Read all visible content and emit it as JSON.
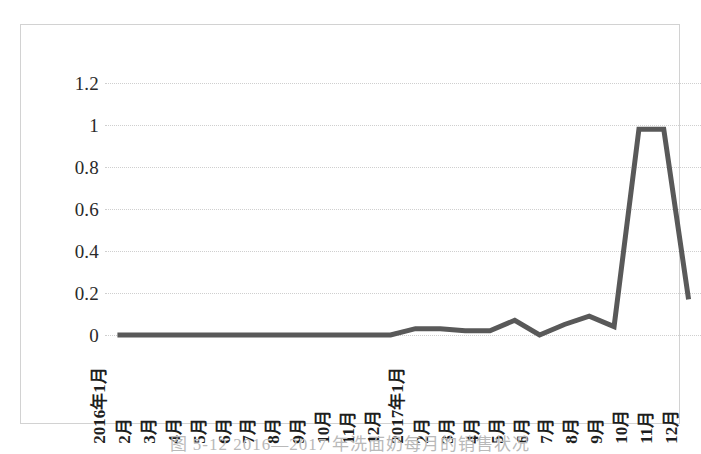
{
  "figure": {
    "caption": "图 5-12  2016—2017 年洗面奶每月的销售状况"
  },
  "chart_data": {
    "type": "line",
    "title": "",
    "subtitle": "",
    "xlabel": "",
    "ylabel": "",
    "ylim": [
      0,
      1.2
    ],
    "y_ticks": [
      "0",
      "0.2",
      "0.4",
      "0.6",
      "0.8",
      "1",
      "1.2"
    ],
    "y_tick_values": [
      0,
      0.2,
      0.4,
      0.6,
      0.8,
      1,
      1.2
    ],
    "grid": true,
    "legend": false,
    "legend_position": "none",
    "line_color": "#595959",
    "line_width": 5,
    "markers": false,
    "categories": [
      "2016年1月",
      "2月",
      "3月",
      "4月",
      "5月",
      "6月",
      "7月",
      "8月",
      "9月",
      "10月",
      "11月",
      "12月",
      "2017年1月",
      "2月",
      "3月",
      "4月",
      "5月",
      "6月",
      "7月",
      "8月",
      "9月",
      "10月",
      "11月",
      "12月"
    ],
    "values": [
      0.0,
      0.0,
      0.0,
      0.0,
      0.0,
      0.0,
      0.0,
      0.0,
      0.0,
      0.0,
      0.0,
      0.0,
      0.03,
      0.03,
      0.02,
      0.02,
      0.07,
      0.0,
      0.05,
      0.09,
      0.04,
      0.98,
      0.98,
      0.17
    ],
    "series": [
      {
        "name": "销售额",
        "values": [
          0.0,
          0.0,
          0.0,
          0.0,
          0.0,
          0.0,
          0.0,
          0.0,
          0.0,
          0.0,
          0.0,
          0.0,
          0.03,
          0.03,
          0.02,
          0.02,
          0.07,
          0.0,
          0.05,
          0.09,
          0.04,
          0.98,
          0.98,
          0.17
        ]
      }
    ]
  },
  "colors": {
    "line": "#595959",
    "gridline": "#cfcfcf",
    "border": "#d2d2d2",
    "background": "#ffffff",
    "tick_text": "#2a2a2a"
  }
}
